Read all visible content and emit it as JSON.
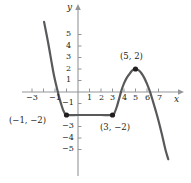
{
  "figure": {
    "title": "",
    "axis_labels": {
      "x": "x",
      "y": "y"
    },
    "colors": {
      "curve": "#58595b",
      "axis": "#808285",
      "point": "#231f20",
      "text": "#231f20",
      "background": "#ffffff"
    }
  },
  "chart_data": {
    "type": "line",
    "title": "",
    "xlabel": "x",
    "ylabel": "y",
    "xlim": [
      -3.8,
      8.2
    ],
    "ylim": [
      -5.8,
      6.2
    ],
    "grid": false,
    "legend": null,
    "x_ticks": [
      -3,
      -1,
      1,
      2,
      3,
      4,
      5,
      6,
      7
    ],
    "x_tick_labels": [
      "-3",
      "-1",
      "1",
      "2",
      "3",
      "4",
      "5",
      "6",
      "7"
    ],
    "y_ticks": [
      5,
      4,
      3,
      2,
      1,
      -1,
      -3,
      -4,
      -5
    ],
    "y_tick_labels": [
      "5",
      "4",
      "3",
      "2",
      "1",
      "-1",
      "-3",
      "-4",
      "-5"
    ],
    "annotations": [
      {
        "label": "(5, 2)",
        "x": 5,
        "y": 2
      },
      {
        "label": "(-1, -2)",
        "x": -1,
        "y": -2
      },
      {
        "label": "(3, -2)",
        "x": 3,
        "y": -2
      }
    ],
    "markers": [
      {
        "x": -1,
        "y": -2
      },
      {
        "x": 3,
        "y": -2
      },
      {
        "x": 5,
        "y": 2
      }
    ],
    "series": [
      {
        "name": "f(x)",
        "points": [
          [
            -2.95,
            6.1
          ],
          [
            -2.6,
            4.3
          ],
          [
            -2.3,
            2.6
          ],
          [
            -2.1,
            1.5
          ],
          [
            -1.9,
            0.6
          ],
          [
            -1.75,
            0.0
          ],
          [
            -1.6,
            -0.6
          ],
          [
            -1.45,
            -1.1
          ],
          [
            -1.3,
            -1.55
          ],
          [
            -1.15,
            -1.85
          ],
          [
            -1.0,
            -2.0
          ],
          [
            0.0,
            -2.0
          ],
          [
            1.0,
            -2.0
          ],
          [
            2.0,
            -2.0
          ],
          [
            3.0,
            -2.0
          ],
          [
            3.2,
            -1.75
          ],
          [
            3.4,
            -1.2
          ],
          [
            3.6,
            -0.5
          ],
          [
            3.8,
            0.2
          ],
          [
            4.0,
            0.75
          ],
          [
            4.25,
            1.25
          ],
          [
            4.5,
            1.6
          ],
          [
            4.75,
            1.9
          ],
          [
            5.0,
            2.0
          ],
          [
            5.25,
            1.9
          ],
          [
            5.5,
            1.65
          ],
          [
            5.75,
            1.25
          ],
          [
            6.0,
            0.7
          ],
          [
            6.25,
            0.05
          ],
          [
            6.5,
            -0.75
          ],
          [
            6.75,
            -1.6
          ],
          [
            7.0,
            -2.5
          ],
          [
            7.3,
            -3.7
          ],
          [
            7.6,
            -5.0
          ],
          [
            7.85,
            -5.85
          ]
        ]
      }
    ]
  },
  "geometry": {
    "origin_px": {
      "x": 78,
      "y": 92
    },
    "unit_px": {
      "x": 11.5,
      "y": 11.5
    }
  },
  "tick_label_positions": {
    "x": [
      {
        "text": "-3",
        "left": 26,
        "top": 94
      },
      {
        "text": "-1",
        "left": 49,
        "top": 94
      },
      {
        "text": "1",
        "left": 87,
        "top": 94
      },
      {
        "text": "2",
        "left": 99,
        "top": 94
      },
      {
        "text": "3",
        "left": 110,
        "top": 94
      },
      {
        "text": "4",
        "left": 122,
        "top": 94
      },
      {
        "text": "5",
        "left": 133,
        "top": 94
      },
      {
        "text": "6",
        "left": 145,
        "top": 94
      },
      {
        "text": "7",
        "left": 157,
        "top": 94
      }
    ],
    "y": [
      {
        "text": "5",
        "left": 66,
        "top": 30
      },
      {
        "text": "4",
        "left": 66,
        "top": 42
      },
      {
        "text": "3",
        "left": 66,
        "top": 53
      },
      {
        "text": "2",
        "left": 66,
        "top": 65
      },
      {
        "text": "1",
        "left": 66,
        "top": 76
      },
      {
        "text": "-1",
        "left": 62,
        "top": 99
      },
      {
        "text": "-3",
        "left": 62,
        "top": 122
      },
      {
        "text": "-4",
        "left": 62,
        "top": 134
      },
      {
        "text": "-5",
        "left": 62,
        "top": 145
      }
    ]
  },
  "annotation_positions": [
    {
      "text": "(5, 2)",
      "left": 120,
      "top": 52
    },
    {
      "text": "(-1, -2)",
      "left": 9,
      "top": 116
    },
    {
      "text": "(3, -2)",
      "left": 100,
      "top": 123
    }
  ],
  "axis_name_positions": {
    "y": {
      "left": 67,
      "top": 3
    },
    "x": {
      "left": 174,
      "top": 95
    }
  }
}
